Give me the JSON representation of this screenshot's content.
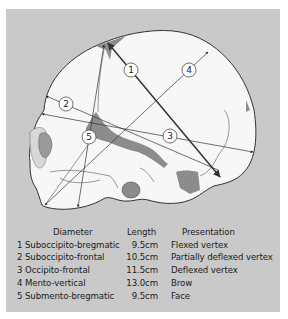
{
  "figure": {
    "title": "",
    "background_color": "#c9c9c9",
    "skull_fill": "#f7f7f7",
    "suture_fill": "#8c8c8c",
    "arrow_color": "#333333"
  },
  "diameter_labels": [
    {
      "id": "1",
      "text": "1"
    },
    {
      "id": "2",
      "text": "2"
    },
    {
      "id": "3",
      "text": "3"
    },
    {
      "id": "4",
      "text": "4"
    },
    {
      "id": "5",
      "text": "5"
    }
  ],
  "table": {
    "headers": {
      "diameter": "Diameter",
      "length": "Length",
      "presentation": "Presentation"
    },
    "rows": [
      {
        "diameter": "1 Suboccipito-bregmatic",
        "length": "9.5cm",
        "presentation": "Flexed vertex"
      },
      {
        "diameter": "2 Suboccipito-frontal",
        "length": "10.5cm",
        "presentation": "Partially deflexed vertex"
      },
      {
        "diameter": "3 Occipito-frontal",
        "length": "11.5cm",
        "presentation": "Deflexed vertex"
      },
      {
        "diameter": "4 Mento-vertical",
        "length": "13.0cm",
        "presentation": "Brow"
      },
      {
        "diameter": "5 Submento-bregmatic",
        "length": "9.5cm",
        "presentation": "Face"
      }
    ]
  }
}
